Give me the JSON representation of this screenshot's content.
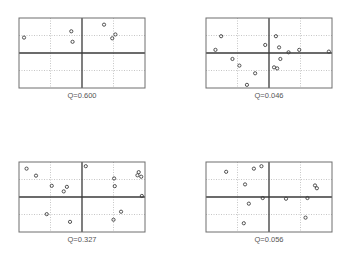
{
  "chart_data": [
    {
      "type": "scatter",
      "title": "",
      "caption": "Q=0.600",
      "xlabel": "",
      "ylabel": "",
      "xlim": [
        -1,
        1
      ],
      "ylim": [
        -1,
        1
      ],
      "grid": true,
      "points": [
        {
          "x": -0.92,
          "y": 0.44
        },
        {
          "x": -0.17,
          "y": 0.62
        },
        {
          "x": -0.15,
          "y": 0.32
        },
        {
          "x": 0.35,
          "y": 0.81
        },
        {
          "x": 0.53,
          "y": 0.53
        },
        {
          "x": 0.48,
          "y": 0.42
        }
      ]
    },
    {
      "type": "scatter",
      "title": "",
      "caption": "Q=0.046",
      "xlabel": "",
      "ylabel": "",
      "xlim": [
        -1,
        1
      ],
      "ylim": [
        -1,
        1
      ],
      "grid": true,
      "points": [
        {
          "x": -0.76,
          "y": 0.48
        },
        {
          "x": -0.85,
          "y": 0.09
        },
        {
          "x": -0.06,
          "y": 0.23
        },
        {
          "x": 0.11,
          "y": 0.48
        },
        {
          "x": 0.16,
          "y": 0.16
        },
        {
          "x": 0.31,
          "y": 0.02
        },
        {
          "x": 0.48,
          "y": 0.09
        },
        {
          "x": 0.95,
          "y": 0.04
        },
        {
          "x": -0.58,
          "y": -0.17
        },
        {
          "x": -0.47,
          "y": -0.36
        },
        {
          "x": 0.18,
          "y": -0.17
        },
        {
          "x": 0.08,
          "y": -0.41
        },
        {
          "x": 0.13,
          "y": -0.44
        },
        {
          "x": -0.22,
          "y": -0.58
        },
        {
          "x": -0.35,
          "y": -0.91
        }
      ]
    },
    {
      "type": "scatter",
      "title": "",
      "caption": "Q=0.327",
      "xlabel": "",
      "ylabel": "",
      "xlim": [
        -1,
        1
      ],
      "ylim": [
        -1,
        1
      ],
      "grid": true,
      "points": [
        {
          "x": -0.88,
          "y": 0.81
        },
        {
          "x": -0.73,
          "y": 0.61
        },
        {
          "x": -0.48,
          "y": 0.32
        },
        {
          "x": -0.24,
          "y": 0.29
        },
        {
          "x": -0.29,
          "y": 0.16
        },
        {
          "x": 0.06,
          "y": 0.88
        },
        {
          "x": 0.51,
          "y": 0.53
        },
        {
          "x": 0.52,
          "y": 0.31
        },
        {
          "x": 0.9,
          "y": 0.71
        },
        {
          "x": 0.88,
          "y": 0.62
        },
        {
          "x": 0.94,
          "y": 0.58
        },
        {
          "x": 0.95,
          "y": 0.03
        },
        {
          "x": -0.56,
          "y": -0.49
        },
        {
          "x": -0.19,
          "y": -0.71
        },
        {
          "x": 0.62,
          "y": -0.42
        },
        {
          "x": 0.5,
          "y": -0.65
        }
      ]
    },
    {
      "type": "scatter",
      "title": "",
      "caption": "Q=0.056",
      "xlabel": "",
      "ylabel": "",
      "xlim": [
        -1,
        1
      ],
      "ylim": [
        -1,
        1
      ],
      "grid": true,
      "points": [
        {
          "x": -0.68,
          "y": 0.72
        },
        {
          "x": -0.24,
          "y": 0.81
        },
        {
          "x": -0.12,
          "y": 0.88
        },
        {
          "x": -0.38,
          "y": 0.36
        },
        {
          "x": 0.73,
          "y": 0.33
        },
        {
          "x": 0.76,
          "y": 0.25
        },
        {
          "x": -0.1,
          "y": -0.03
        },
        {
          "x": 0.27,
          "y": -0.05
        },
        {
          "x": 0.61,
          "y": -0.03
        },
        {
          "x": -0.32,
          "y": -0.19
        },
        {
          "x": 0.58,
          "y": -0.59
        },
        {
          "x": -0.4,
          "y": -0.75
        }
      ]
    }
  ]
}
